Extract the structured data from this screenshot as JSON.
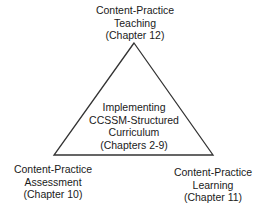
{
  "diagram": {
    "type": "triangle",
    "top": {
      "line1": "Content-Practice",
      "line2": "Teaching",
      "line3": "(Chapter 12)"
    },
    "center": {
      "line1": "Implementing",
      "line2": "CCSSM-Structured",
      "line3": "Curriculum",
      "line4": "(Chapters 2-9)"
    },
    "bottom_left": {
      "line1": "Content-Practice",
      "line2": "Assessment",
      "line3": "(Chapter 10)"
    },
    "bottom_right": {
      "line1": "Content-Practice",
      "line2": "Learning",
      "line3": "(Chapter 11)"
    },
    "colors": {
      "stroke": "#333333",
      "text": "#1a1a1a",
      "background": "#ffffff"
    }
  }
}
